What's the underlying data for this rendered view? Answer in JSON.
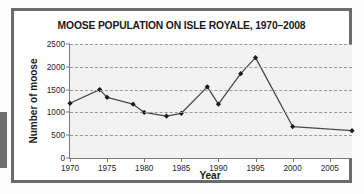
{
  "figure": {
    "title": "MOOSE POPULATION ON ISLE ROYALE, 1970–2008",
    "frame_color": "#6b6b6b",
    "plot_background": "#f2f2f2",
    "series_color": "#4a4a4a",
    "gridline_color": "#9a9a9a"
  },
  "chart_data": {
    "type": "line",
    "title": "MOOSE POPULATION ON ISLE ROYALE, 1970–2008",
    "xlabel": "Year",
    "ylabel": "Number of moose",
    "xlim": [
      1970,
      2008
    ],
    "ylim": [
      0,
      2500
    ],
    "xticks": [
      1970,
      1975,
      1980,
      1985,
      1990,
      1995,
      2000,
      2005
    ],
    "xtick_labels": [
      "1970",
      "1975",
      "1980",
      "1985",
      "1990",
      "1995",
      "2000",
      "2005"
    ],
    "yticks": [
      0,
      500,
      1000,
      1500,
      2000,
      2500
    ],
    "ytick_labels": [
      "0",
      "500",
      "1000",
      "1500",
      "2000",
      "2500"
    ],
    "grid": "horizontal-dashed",
    "legend": "none",
    "marker": "filled-diamond",
    "x": [
      1970,
      1974,
      1975,
      1978.5,
      1980,
      1983,
      1985,
      1988.5,
      1990,
      1993,
      1995,
      2000,
      2008
    ],
    "values": [
      1200,
      1500,
      1330,
      1180,
      1000,
      920,
      980,
      1560,
      1180,
      1850,
      2200,
      690,
      600
    ],
    "series": [
      {
        "name": "Number of moose",
        "points": [
          {
            "x": 1970,
            "y": 1200
          },
          {
            "x": 1974,
            "y": 1500
          },
          {
            "x": 1975,
            "y": 1330
          },
          {
            "x": 1978.5,
            "y": 1180
          },
          {
            "x": 1980,
            "y": 1000
          },
          {
            "x": 1983,
            "y": 920
          },
          {
            "x": 1985,
            "y": 980
          },
          {
            "x": 1988.5,
            "y": 1560
          },
          {
            "x": 1990,
            "y": 1180
          },
          {
            "x": 1993,
            "y": 1850
          },
          {
            "x": 1995,
            "y": 2200
          },
          {
            "x": 2000,
            "y": 690
          },
          {
            "x": 2008,
            "y": 600
          }
        ]
      }
    ]
  }
}
